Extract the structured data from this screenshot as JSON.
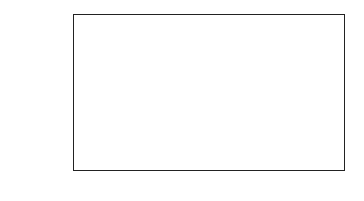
{
  "chart_data": {
    "type": "bar",
    "title": "",
    "xlabel": "",
    "ylabel": "Percent Responses",
    "categories": [
      "A",
      "B",
      "C",
      "D"
    ],
    "values": [
      11.0,
      13.0,
      42.0,
      34.0
    ],
    "bar_colors": [
      "#b3b3b3",
      "#b3b3b3",
      "#111111",
      "#b3b3b3"
    ],
    "ylim": [
      0,
      45
    ],
    "yticks": [
      "0.0",
      "5.0",
      "10.0",
      "15.0",
      "20.0",
      "25.0",
      "30.0",
      "35.0",
      "40.0",
      "45.0"
    ],
    "grid": true,
    "legend": null
  }
}
